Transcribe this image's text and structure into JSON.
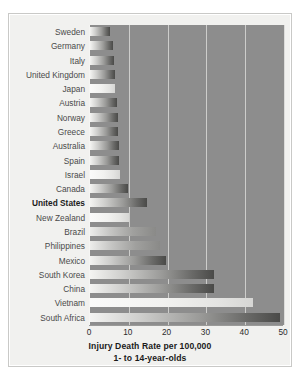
{
  "chart_data": {
    "type": "bar",
    "orientation": "horizontal",
    "title": "",
    "xlabel": "Injury Death Rate per 100,000",
    "xlabel_line2": "1- to 14-year-olds",
    "ylabel": "",
    "xlim": [
      0,
      50
    ],
    "xticks": [
      0,
      10,
      20,
      30,
      40,
      50
    ],
    "grid": "vertical",
    "legend": "none",
    "highlight_category": "United States",
    "categories": [
      "Sweden",
      "Germany",
      "Italy",
      "United Kingdom",
      "Japan",
      "Austria",
      "Norway",
      "Greece",
      "Australia",
      "Spain",
      "Israel",
      "Canada",
      "United States",
      "New Zealand",
      "Brazil",
      "Philippines",
      "Mexico",
      "South Korea",
      "China",
      "Vietnam",
      "South Africa"
    ],
    "values": [
      5.2,
      6.0,
      6.1,
      6.4,
      6.5,
      7.0,
      7.2,
      7.3,
      7.5,
      7.6,
      7.8,
      9.7,
      14.7,
      10.0,
      17.0,
      18.0,
      19.5,
      32.0,
      32.0,
      42.0,
      49.0
    ],
    "bar_styles": [
      "grad",
      "grad",
      "grad",
      "grad",
      "pale",
      "grad",
      "grad",
      "grad",
      "grad",
      "grad",
      "pale",
      "grad",
      "grad",
      "pale",
      "mid",
      "mid",
      "grad",
      "grad",
      "grad",
      "pale",
      "grad"
    ],
    "colors": {
      "plot_background": "#8d8d8d",
      "figure_background": "#f1f1ef",
      "gridline": "#d8d8d6",
      "label_text": "#4a4a4a",
      "highlight_text": "#1c1c1c"
    }
  },
  "figure": {
    "caption_line1": "Injury Death Rate per 100,000",
    "caption_line2": "1- to 14-year-olds"
  }
}
